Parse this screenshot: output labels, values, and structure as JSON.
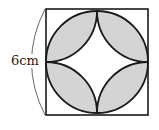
{
  "figure": {
    "side_label": "6cm",
    "shape": "square with inscribed circle and four quarter-circle arcs centered at side midpoints",
    "colors": {
      "stroke": "#1a1a1a",
      "shaded": "#d4d4d4",
      "background": "#ffffff"
    }
  }
}
